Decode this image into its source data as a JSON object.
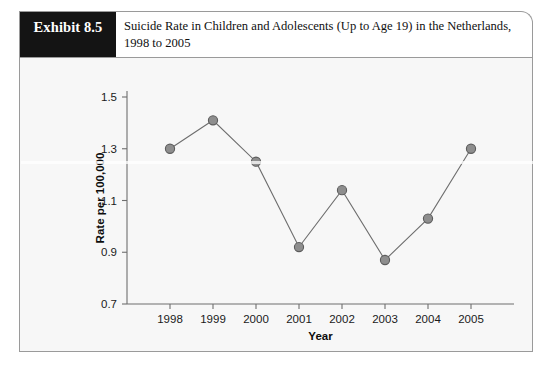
{
  "exhibit": {
    "badge_label": "Exhibit 8.5",
    "title_line1": "Suicide Rate in Children and Adolescents (Up to Age 19) in the Netherlands,",
    "title_line2": "1998 to 2005"
  },
  "chart_data": {
    "type": "line",
    "title": "",
    "xlabel": "Year",
    "ylabel": "Rate per 100,000",
    "categories": [
      "1998",
      "1999",
      "2000",
      "2001",
      "2002",
      "2003",
      "2004",
      "2005"
    ],
    "values": [
      1.3,
      1.41,
      1.25,
      0.92,
      1.14,
      0.87,
      1.03,
      1.3
    ],
    "series": [
      {
        "name": "Suicide rate per 100,000",
        "values": [
          1.3,
          1.41,
          1.25,
          0.92,
          1.14,
          0.87,
          1.03,
          1.3
        ]
      }
    ],
    "ylim": [
      0.7,
      1.5
    ],
    "yticks": [
      "0.7",
      "0.9",
      "1.1",
      "1.3",
      "1.5"
    ],
    "ytick_values": [
      0.7,
      0.9,
      1.1,
      1.3,
      1.5
    ],
    "xticks": [
      "1998",
      "1999",
      "2000",
      "2001",
      "2002",
      "2003",
      "2004",
      "2005"
    ],
    "grid": false,
    "legend": "none",
    "marker": "circle",
    "marker_color": "#8e8e8e",
    "line_color": "#6e6e6e",
    "plot_background": "#f7f7f7"
  }
}
